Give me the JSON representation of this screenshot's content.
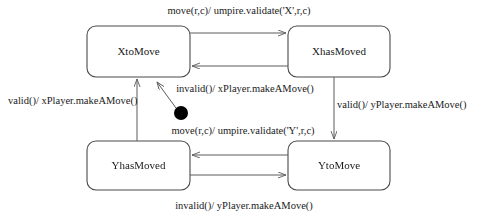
{
  "diagram": {
    "type": "uml-state-machine",
    "background_color": "#ffffff",
    "line_color": "#5a5a5a",
    "text_color": "#1a1a1a",
    "states": [
      {
        "id": "XtoMove",
        "label": "XtoMove",
        "x": 87,
        "y": 26,
        "width": 103,
        "height": 51
      },
      {
        "id": "XhasMoved",
        "label": "XhasMoved",
        "x": 288,
        "y": 26,
        "width": 102,
        "height": 51
      },
      {
        "id": "YhasMoved",
        "label": "YhasMoved",
        "x": 87,
        "y": 141,
        "width": 103,
        "height": 49
      },
      {
        "id": "YtoMove",
        "label": "YtoMove",
        "x": 288,
        "y": 141,
        "width": 102,
        "height": 49
      }
    ],
    "initial_pseudostate": {
      "name": "initial-state-dot",
      "cx": 181,
      "cy": 113,
      "r": 7,
      "target": "XtoMove"
    },
    "transitions": [
      {
        "id": "x-move",
        "from": "XtoMove",
        "to": "XhasMoved",
        "label": "move(r,c)/ umpire.validate('X',r,c)",
        "label_x": 239,
        "label_y": 14
      },
      {
        "id": "x-invalid",
        "from": "XhasMoved",
        "to": "XtoMove",
        "label": "invalid()/  xPlayer.makeAMove()",
        "label_x": 245,
        "label_y": 92
      },
      {
        "id": "x-valid",
        "from": "YhasMoved",
        "to": "XtoMove",
        "label": "valid()/  xPlayer.makeAMove()",
        "label_x": 8,
        "label_y": 104
      },
      {
        "id": "y-valid",
        "from": "XhasMoved",
        "to": "YtoMove",
        "label": "valid()/  yPlayer.makeAMove()",
        "label_x": 337,
        "label_y": 108
      },
      {
        "id": "y-move",
        "from": "YtoMove",
        "to": "YhasMoved",
        "label": "move(r,c)/  umpire.validate('Y',r,c)",
        "label_x": 243,
        "label_y": 134
      },
      {
        "id": "y-invalid",
        "from": "YhasMoved",
        "to": "YtoMove",
        "label": "invalid()/  yPlayer.makeAMove()",
        "label_x": 244,
        "label_y": 209
      }
    ]
  }
}
